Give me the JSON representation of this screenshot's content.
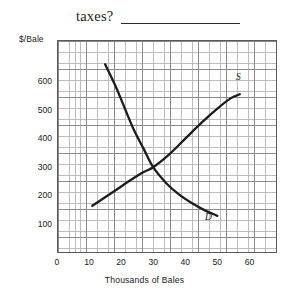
{
  "question": {
    "text": "taxes?",
    "answer_blank": ""
  },
  "chart_data": {
    "type": "line",
    "title": "",
    "xlabel": "Thousands of Bales",
    "ylabel": "$/Bale",
    "xlim": [
      0,
      68.6
    ],
    "ylim": [
      0,
      745
    ],
    "grid": true,
    "major_grid_step_x": 10,
    "major_grid_step_y": 100,
    "minor_grid_step_x": 2,
    "minor_grid_step_y": 20,
    "xticks": [
      0,
      10,
      20,
      30,
      40,
      50,
      60
    ],
    "xtick_labels": [
      "0",
      "10",
      "20",
      "30",
      "40",
      "50",
      "60"
    ],
    "yticks": [
      100,
      200,
      300,
      400,
      500,
      600
    ],
    "ytick_labels": [
      "100",
      "200",
      "300",
      "400",
      "500",
      "600"
    ],
    "legend": "inline-curve-labels",
    "series": [
      {
        "name": "D",
        "label": "D",
        "label_position": [
          52.5,
          127
        ],
        "description": "downward-sloping convex demand curve",
        "points": [
          [
            15,
            660
          ],
          [
            18,
            590
          ],
          [
            21,
            510
          ],
          [
            24,
            430
          ],
          [
            27,
            365
          ],
          [
            30,
            300
          ],
          [
            34,
            245
          ],
          [
            38,
            205
          ],
          [
            42,
            175
          ],
          [
            46,
            150
          ],
          [
            50,
            130
          ]
        ]
      },
      {
        "name": "S",
        "label": "S",
        "label_position": [
          59.5,
          585
        ],
        "description": "upward-sloping convex supply curve",
        "points": [
          [
            11,
            165
          ],
          [
            15,
            195
          ],
          [
            19,
            225
          ],
          [
            23,
            255
          ],
          [
            27,
            283
          ],
          [
            30,
            300
          ],
          [
            35,
            345
          ],
          [
            40,
            400
          ],
          [
            45,
            455
          ],
          [
            50,
            505
          ],
          [
            54,
            540
          ],
          [
            57,
            555
          ]
        ]
      }
    ],
    "equilibrium": {
      "x": 30,
      "y": 300
    }
  }
}
